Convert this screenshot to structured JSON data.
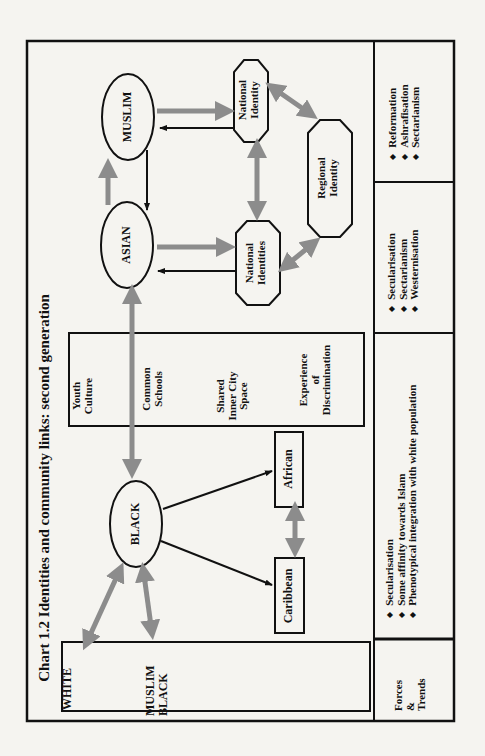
{
  "chart": {
    "title": "Chart 1.2  Identities and community links: second generation"
  },
  "nodes": {
    "muslim": "MUSLIM",
    "asian": "ASIAN",
    "black": "BLACK",
    "national_identity": [
      "National",
      "Identity"
    ],
    "national_identities": [
      "National",
      "Identities"
    ],
    "regional_identity": [
      "Regional",
      "Identity"
    ],
    "african": "African",
    "caribbean": "Caribbean",
    "white": "WHITE",
    "muslim_black": [
      "MUSLIM",
      "BLACK"
    ]
  },
  "shared_factors": {
    "items": [
      [
        "Youth",
        "Culture"
      ],
      [
        "Common",
        "Schools"
      ],
      [
        "Shared",
        "Inner City",
        "Space"
      ],
      [
        "Experience",
        "of",
        "Discrimination"
      ]
    ]
  },
  "forces_trends": {
    "label": [
      "Forces",
      "&",
      "Trends"
    ],
    "black_column": [
      "Secularisation",
      "Some affinity towards Islam",
      "Phenotypical integration with white population"
    ],
    "asian_column": [
      "Secularisation",
      "Sectarianism",
      "Westernisation"
    ],
    "muslim_column": [
      "Reformation",
      "Ashrafisation",
      "Sectarianism"
    ]
  },
  "colors": {
    "frame": "#111111",
    "grey_arrow": "#8c8c8c",
    "black_arrow": "#111111",
    "background": "#f5f4f0"
  }
}
